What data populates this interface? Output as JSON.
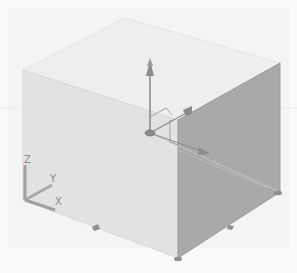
{
  "viewport": {
    "background": "#fafafa",
    "grid_band_color": "#f2f2f2",
    "view": "SE Isometric"
  },
  "solid": {
    "type": "box",
    "colors": {
      "top_face": "#eeeeee",
      "front_face": "#e3e3e3",
      "right_face": "#a8a8a8",
      "edge": "#d0d0d0"
    }
  },
  "gizmo": {
    "type": "move-gizmo",
    "axis_color": "#8c8c8c",
    "axes": [
      "X",
      "Y",
      "Z"
    ]
  },
  "ucs_icon": {
    "labels": {
      "x": "X",
      "y": "Y",
      "z": "Z"
    },
    "color": "#9a9a9a"
  },
  "grips": {
    "count": 4,
    "color": "#8e8e8e"
  }
}
